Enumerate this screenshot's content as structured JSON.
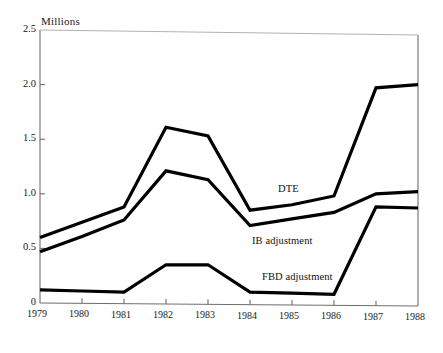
{
  "chart_data": {
    "type": "line",
    "title": "",
    "subtitle": "",
    "xlabel": "",
    "ylabel": "Millions",
    "ylim": [
      0,
      2.5
    ],
    "xlim": [
      1979,
      1988
    ],
    "grid": false,
    "legend_position": "inline-annotations",
    "y_ticks": [
      "0",
      "0.5",
      "1.0",
      "1.5",
      "2.0",
      "2.5"
    ],
    "y_tick_values": [
      0,
      0.5,
      1.0,
      1.5,
      2.0,
      2.5
    ],
    "x": [
      1979,
      1980,
      1981,
      1982,
      1983,
      1984,
      1985,
      1986,
      1987,
      1988
    ],
    "categories": [
      "1979",
      "1980",
      "1981",
      "1982",
      "1983",
      "1984",
      "1985",
      "1986",
      "1987",
      "1988"
    ],
    "series": [
      {
        "name": "DTE",
        "color": "#000000",
        "values": [
          0.6,
          0.74,
          0.88,
          1.61,
          1.53,
          0.85,
          0.9,
          0.98,
          1.97,
          2.0
        ]
      },
      {
        "name": "IB adjustment",
        "color": "#000000",
        "values": [
          0.47,
          0.61,
          0.76,
          1.21,
          1.13,
          0.71,
          0.77,
          0.83,
          1.0,
          1.02
        ]
      },
      {
        "name": "FBD adjustment",
        "color": "#000000",
        "values": [
          0.12,
          0.11,
          0.1,
          0.35,
          0.35,
          0.1,
          0.09,
          0.08,
          0.88,
          0.87
        ]
      }
    ],
    "annotations": [
      {
        "text": "DTE",
        "x": 1985.0,
        "y": 1.12
      },
      {
        "text": "IB adjustment",
        "x": 1984.6,
        "y": 0.63
      },
      {
        "text": "FBD adjustment",
        "x": 1984.9,
        "y": 0.28
      }
    ]
  },
  "axis": {
    "y_title": "Millions",
    "y_ticks": [
      "2.5",
      "2.0",
      "1.5",
      "1.0",
      "0.5",
      "0"
    ],
    "x_ticks": [
      "1979",
      "1980",
      "1981",
      "1982",
      "1983",
      "1984",
      "1985",
      "1986",
      "1987",
      "1988"
    ]
  },
  "labels": {
    "dte": "DTE",
    "ib": "IB adjustment",
    "fbd": "FBD adjustment"
  },
  "colors": {
    "line": "#000000",
    "frame": "#6e6e6e",
    "background": "#ffffff",
    "text": "#1a1a1a"
  }
}
